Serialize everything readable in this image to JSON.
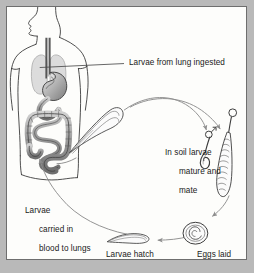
{
  "figure": {
    "background_color": "#b9b9b9",
    "panel_color": "#fdfdfb",
    "border_color": "#6e6e6e",
    "ink_color": "#1a1a1a",
    "arrow_color": "#8d8d8d",
    "organ_fill": "#b5b5b5",
    "lung_fill": "#dcdcdc"
  },
  "labels": {
    "ingested": "Larvae from lung ingested",
    "soil_line1": "In soil larvae",
    "soil_line2": "mature and",
    "soil_line3": "mate",
    "blood_line1": "Larvae",
    "blood_line2": "carried in",
    "blood_line3": "blood to lungs",
    "hatch_line1": "Larvae hatch",
    "hatch_line2": "and enter skin",
    "eggs": "Eggs laid"
  },
  "symbols": {
    "male": "♂"
  },
  "parts": {
    "human_torso": "human-torso-outline",
    "lungs": "lungs",
    "trachea": "trachea-esophagus",
    "stomach": "stomach",
    "small_intestine": "small-intestine",
    "large_intestine": "large-intestine",
    "adult_worm": "adult-worm",
    "male_worm": "male-worm",
    "female_worm": "female-worm",
    "egg": "egg-with-coiled-larva",
    "larva": "larva"
  }
}
